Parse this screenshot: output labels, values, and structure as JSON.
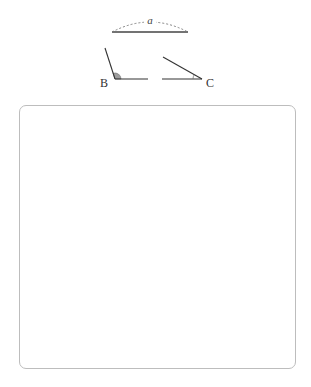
{
  "figure": {
    "segment": {
      "label": "a",
      "x1": 112,
      "x2": 188,
      "y": 32,
      "arc_peak_y": 20
    },
    "angle_b": {
      "label": "B",
      "vertex": [
        115,
        79
      ],
      "ray1_end": [
        105,
        48
      ],
      "ray2_end": [
        148,
        79
      ],
      "fill": "#9e9e9e"
    },
    "angle_c": {
      "label": "C",
      "vertex": [
        202,
        79
      ],
      "ray1_end": [
        162,
        79
      ],
      "ray2_end": [
        163,
        57
      ]
    },
    "stroke_color": "#333333"
  },
  "answer_box": {
    "content": ""
  }
}
